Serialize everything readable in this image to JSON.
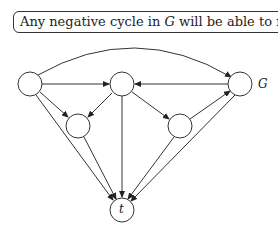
{
  "caption": {
    "prefix": "Any negative cycle in ",
    "graph_var": "G",
    "middle": " will be able to reach ",
    "target_var": "t",
    "suffix": "."
  },
  "graph": {
    "label": "G",
    "nodes": [
      {
        "id": "a",
        "label": "",
        "cx": 30,
        "cy": 84
      },
      {
        "id": "b",
        "label": "",
        "cx": 122,
        "cy": 84
      },
      {
        "id": "c",
        "label": "",
        "cx": 240,
        "cy": 84
      },
      {
        "id": "d",
        "label": "",
        "cx": 78,
        "cy": 126
      },
      {
        "id": "e",
        "label": "",
        "cx": 180,
        "cy": 126
      },
      {
        "id": "t",
        "label": "t",
        "cx": 122,
        "cy": 210
      }
    ],
    "edges": [
      {
        "from": "a",
        "to": "c",
        "curved": true
      },
      {
        "from": "a",
        "to": "b"
      },
      {
        "from": "c",
        "to": "b"
      },
      {
        "from": "a",
        "to": "d"
      },
      {
        "from": "b",
        "to": "d"
      },
      {
        "from": "b",
        "to": "e"
      },
      {
        "from": "e",
        "to": "c"
      },
      {
        "from": "a",
        "to": "t"
      },
      {
        "from": "d",
        "to": "t"
      },
      {
        "from": "b",
        "to": "t"
      },
      {
        "from": "e",
        "to": "t"
      },
      {
        "from": "c",
        "to": "t"
      }
    ]
  }
}
